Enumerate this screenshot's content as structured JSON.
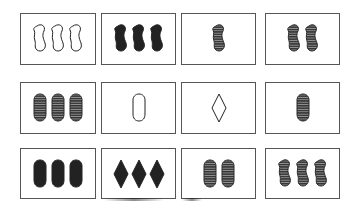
{
  "game": {
    "title": "SET",
    "colors": {
      "ink": "#222222",
      "stripe_dark": "#333333",
      "stripe_light": "#9a9a9a",
      "border": "#555555"
    }
  },
  "cards": [
    {
      "row": 0,
      "col": 0,
      "count": 3,
      "shape": "squiggle",
      "shading": "open"
    },
    {
      "row": 0,
      "col": 1,
      "count": 3,
      "shape": "squiggle",
      "shading": "solid"
    },
    {
      "row": 0,
      "col": 2,
      "count": 1,
      "shape": "squiggle",
      "shading": "striped"
    },
    {
      "row": 0,
      "col": 3,
      "count": 2,
      "shape": "squiggle",
      "shading": "striped"
    },
    {
      "row": 1,
      "col": 0,
      "count": 3,
      "shape": "oval",
      "shading": "striped"
    },
    {
      "row": 1,
      "col": 1,
      "count": 1,
      "shape": "oval",
      "shading": "open"
    },
    {
      "row": 1,
      "col": 2,
      "count": 1,
      "shape": "diamond",
      "shading": "open"
    },
    {
      "row": 1,
      "col": 3,
      "count": 1,
      "shape": "oval",
      "shading": "striped"
    },
    {
      "row": 2,
      "col": 0,
      "count": 3,
      "shape": "oval",
      "shading": "solid"
    },
    {
      "row": 2,
      "col": 1,
      "count": 3,
      "shape": "diamond",
      "shading": "solid"
    },
    {
      "row": 2,
      "col": 2,
      "count": 2,
      "shape": "oval",
      "shading": "striped"
    },
    {
      "row": 2,
      "col": 3,
      "count": 3,
      "shape": "squiggle",
      "shading": "striped"
    }
  ]
}
